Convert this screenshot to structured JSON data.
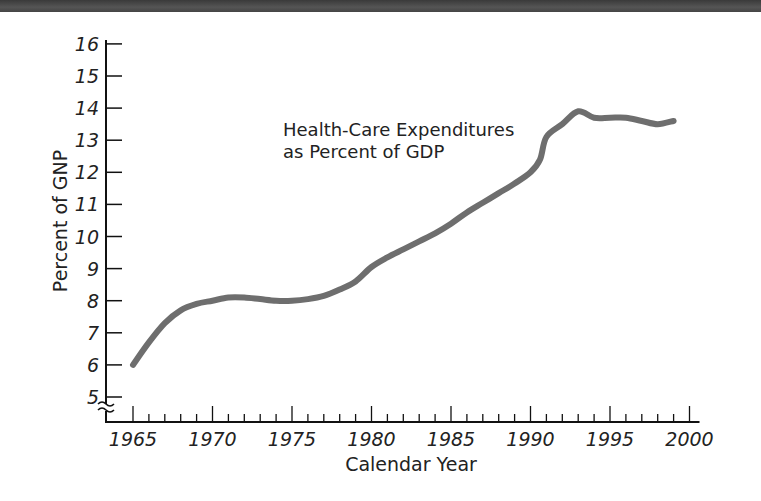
{
  "chart_data": {
    "type": "line",
    "title": "Health-Care Expenditures as Percent of GDP",
    "annotation_lines": [
      "Health-Care Expenditures",
      "as Percent of GDP"
    ],
    "xlabel": "Calendar Year",
    "ylabel": "Percent of GNP",
    "xlim": [
      1963.3,
      2001.5
    ],
    "ylim": [
      5,
      16
    ],
    "x_ticks_major": [
      1965,
      1970,
      1975,
      1980,
      1985,
      1990,
      1995,
      2000
    ],
    "x_tick_labels": [
      "1965",
      "1970",
      "1975",
      "1980",
      "1985",
      "1990",
      "1995",
      "2000"
    ],
    "y_ticks": [
      5,
      6,
      7,
      8,
      9,
      10,
      11,
      12,
      13,
      14,
      15,
      16
    ],
    "y_tick_labels": [
      "5",
      "6",
      "7",
      "8",
      "9",
      "10",
      "11",
      "12",
      "13",
      "14",
      "15",
      "16"
    ],
    "axis_break": "y-axis broken below 5",
    "grid": false,
    "legend": null,
    "series": [
      {
        "name": "Health-Care Expenditures as Percent of GDP",
        "color": "#6e6e6e",
        "x": [
          1965,
          1966,
          1967,
          1968,
          1969,
          1970,
          1971,
          1972,
          1973,
          1974,
          1975,
          1976,
          1977,
          1978,
          1979,
          1980,
          1981,
          1982,
          1983,
          1984,
          1985,
          1986,
          1987,
          1988,
          1989,
          1990,
          1990.6,
          1991,
          1992,
          1993,
          1994,
          1995,
          1996,
          1997,
          1998,
          1999
        ],
        "values": [
          6.0,
          6.7,
          7.3,
          7.7,
          7.9,
          8.0,
          8.1,
          8.1,
          8.05,
          8.0,
          8.0,
          8.05,
          8.15,
          8.35,
          8.6,
          9.05,
          9.35,
          9.6,
          9.85,
          10.1,
          10.4,
          10.75,
          11.05,
          11.35,
          11.65,
          12.0,
          12.4,
          13.1,
          13.5,
          13.9,
          13.7,
          13.7,
          13.7,
          13.6,
          13.5,
          13.6
        ]
      }
    ]
  }
}
